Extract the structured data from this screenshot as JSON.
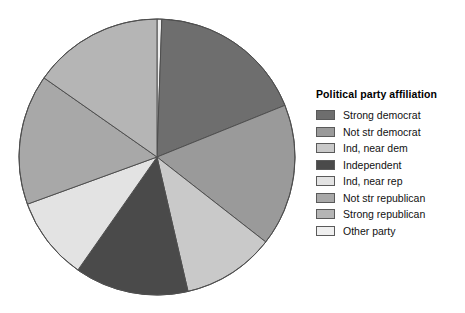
{
  "chart_data": {
    "type": "pie",
    "title": "",
    "legend_title": "Political party affiliation",
    "legend_position": "right",
    "grid": false,
    "start_angle_deg": 0,
    "direction": "clockwise",
    "categories": [
      "Strong democrat",
      "Not str democrat",
      "Ind, near dem",
      "Independent",
      "Ind, near rep",
      "Not str republican",
      "Strong republican",
      "Other party"
    ],
    "values": [
      18.3,
      16.7,
      10.8,
      13.3,
      9.7,
      15.3,
      14.7,
      1.2
    ],
    "units": "percent",
    "colors": [
      "#6e6e6e",
      "#9a9a9a",
      "#c9c9c9",
      "#4a4a4a",
      "#e3e3e3",
      "#a8a8a8",
      "#b5b5b5",
      "#efefef"
    ],
    "slice_angles_deg": [
      {
        "name": "Other party",
        "start": 0.0,
        "end": 2.0
      },
      {
        "name": "Strong democrat",
        "start": 2.0,
        "end": 68.0
      },
      {
        "name": "Not str democrat",
        "start": 68.0,
        "end": 128.0
      },
      {
        "name": "Ind, near dem",
        "start": 128.0,
        "end": 167.0
      },
      {
        "name": "Independent",
        "start": 167.0,
        "end": 215.0
      },
      {
        "name": "Ind, near rep",
        "start": 215.0,
        "end": 250.0
      },
      {
        "name": "Not str republican",
        "start": 250.0,
        "end": 305.0
      },
      {
        "name": "Strong republican",
        "start": 305.0,
        "end": 360.0
      }
    ],
    "xlabel": "",
    "ylabel": ""
  },
  "legend": {
    "title": "Political party affiliation",
    "items": [
      {
        "label": "Strong democrat",
        "color": "#6e6e6e"
      },
      {
        "label": "Not str democrat",
        "color": "#9a9a9a"
      },
      {
        "label": "Ind, near dem",
        "color": "#c9c9c9"
      },
      {
        "label": "Independent",
        "color": "#4a4a4a"
      },
      {
        "label": "Ind, near rep",
        "color": "#e3e3e3"
      },
      {
        "label": "Not str republican",
        "color": "#a8a8a8"
      },
      {
        "label": "Strong republican",
        "color": "#b5b5b5"
      },
      {
        "label": "Other party",
        "color": "#efefef"
      }
    ]
  },
  "pie": {
    "center_x": 157,
    "center_y": 157,
    "radius": 138,
    "stroke": "#4f4f4f",
    "stroke_width": 1
  }
}
